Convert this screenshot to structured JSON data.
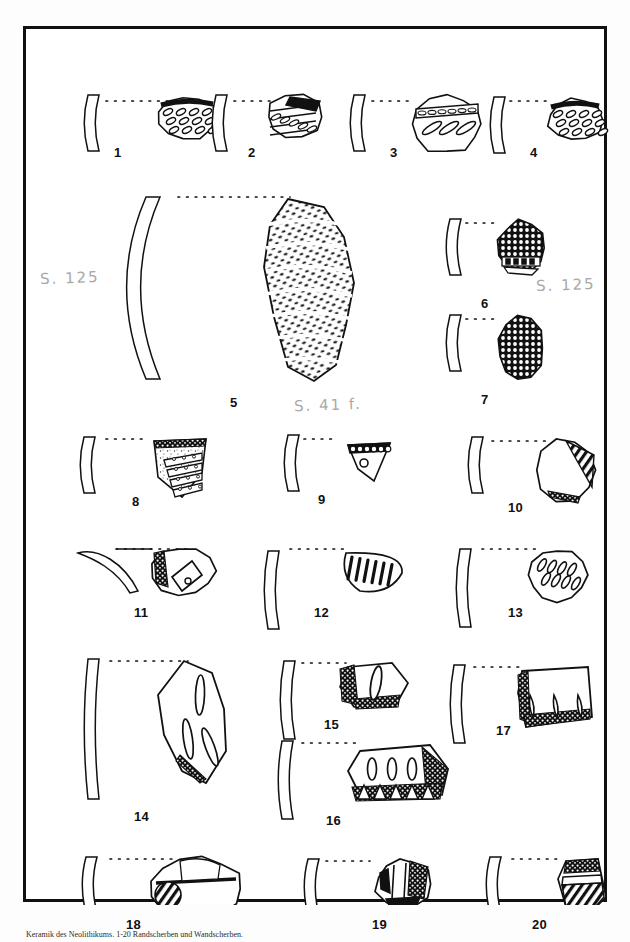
{
  "plate": {
    "title": "Archaeological pottery sherd plate",
    "caption": "Keramik des Neolithikums. 1-20 Randscherben und Wandscherben.",
    "frame_color": "#111111",
    "ink_color": "#111111",
    "pencil_color": "#9a9a9a",
    "background": "#ffffff"
  },
  "annotations": [
    {
      "id": "note-left",
      "text": "S. 125",
      "x": 14,
      "y": 240
    },
    {
      "id": "note-right",
      "text": "S. 125",
      "x": 510,
      "y": 247
    },
    {
      "id": "note-center",
      "text": "S. 41 f.",
      "x": 268,
      "y": 367
    }
  ],
  "items": [
    {
      "n": "1",
      "label_x": 88,
      "label_y": 116,
      "profile_x": 62,
      "profile_y": 66,
      "rim_x": 80,
      "rim_y": 72,
      "rim_w": 62,
      "sherd_x": 132,
      "sherd_y": 68,
      "decor": "oval-rows"
    },
    {
      "n": "2",
      "label_x": 222,
      "label_y": 116,
      "profile_x": 190,
      "profile_y": 66,
      "rim_x": 208,
      "rim_y": 72,
      "rim_w": 36,
      "sherd_x": 240,
      "sherd_y": 66,
      "decor": "diagonal-bands"
    },
    {
      "n": "3",
      "label_x": 364,
      "label_y": 116,
      "profile_x": 328,
      "profile_y": 66,
      "rim_x": 346,
      "rim_y": 72,
      "rim_w": 42,
      "sherd_x": 386,
      "sherd_y": 66,
      "decor": "slash-band"
    },
    {
      "n": "4",
      "label_x": 504,
      "label_y": 116,
      "profile_x": 468,
      "profile_y": 68,
      "rim_x": 484,
      "rim_y": 72,
      "rim_w": 42,
      "sherd_x": 522,
      "sherd_y": 70,
      "decor": "oval-rows"
    },
    {
      "n": "5",
      "label_x": 204,
      "label_y": 366,
      "profile_x": 120,
      "profile_y": 168,
      "rim_x": 152,
      "rim_y": 168,
      "rim_w": 112,
      "sherd_x": 232,
      "sherd_y": 168,
      "decor": "comb-wavy"
    },
    {
      "n": "6",
      "label_x": 455,
      "label_y": 267,
      "profile_x": 424,
      "profile_y": 190,
      "rim_x": 440,
      "rim_y": 194,
      "rim_w": 34,
      "sherd_x": 472,
      "sherd_y": 192,
      "decor": "net-dots"
    },
    {
      "n": "7",
      "label_x": 455,
      "label_y": 363,
      "profile_x": 424,
      "profile_y": 286,
      "rim_x": 440,
      "rim_y": 290,
      "rim_w": 34,
      "sherd_x": 472,
      "sherd_y": 288,
      "decor": "net-dots"
    },
    {
      "n": "8",
      "label_x": 106,
      "label_y": 465,
      "profile_x": 58,
      "profile_y": 408,
      "rim_x": 80,
      "rim_y": 410,
      "rim_w": 42,
      "sherd_x": 122,
      "sherd_y": 408,
      "decor": "stipple-bands"
    },
    {
      "n": "9",
      "label_x": 292,
      "label_y": 463,
      "profile_x": 262,
      "profile_y": 406,
      "rim_x": 278,
      "rim_y": 410,
      "rim_w": 32,
      "sherd_x": 318,
      "sherd_y": 410,
      "decor": "circle-row"
    },
    {
      "n": "10",
      "label_x": 482,
      "label_y": 471,
      "profile_x": 446,
      "profile_y": 408,
      "rim_x": 466,
      "rim_y": 412,
      "rim_w": 56,
      "sherd_x": 510,
      "sherd_y": 410,
      "decor": "hatched-corner"
    },
    {
      "n": "11",
      "label_x": 108,
      "label_y": 576,
      "profile_x": 52,
      "profile_y": 518,
      "rim_x": 90,
      "rim_y": 520,
      "rim_w": 76,
      "sherd_x": 126,
      "sherd_y": 518,
      "decor": "lug-handle"
    },
    {
      "n": "12",
      "label_x": 288,
      "label_y": 576,
      "profile_x": 242,
      "profile_y": 522,
      "rim_x": 264,
      "rim_y": 520,
      "rim_w": 56,
      "sherd_x": 312,
      "sherd_y": 520,
      "decor": "slash-fan"
    },
    {
      "n": "13",
      "label_x": 482,
      "label_y": 576,
      "profile_x": 434,
      "profile_y": 520,
      "rim_x": 456,
      "rim_y": 520,
      "rim_w": 56,
      "sherd_x": 502,
      "sherd_y": 520,
      "decor": "oval-slashes"
    },
    {
      "n": "14",
      "label_x": 108,
      "label_y": 780,
      "profile_x": 62,
      "profile_y": 630,
      "rim_x": 84,
      "rim_y": 632,
      "rim_w": 78,
      "sherd_x": 128,
      "sherd_y": 630,
      "decor": "slot-impressions"
    },
    {
      "n": "15",
      "label_x": 298,
      "label_y": 688,
      "profile_x": 258,
      "profile_y": 632,
      "rim_x": 276,
      "rim_y": 634,
      "rim_w": 44,
      "sherd_x": 312,
      "sherd_y": 632,
      "decor": "rough-edge-oval"
    },
    {
      "n": "16",
      "label_x": 300,
      "label_y": 784,
      "profile_x": 256,
      "profile_y": 712,
      "rim_x": 276,
      "rim_y": 714,
      "rim_w": 58,
      "sherd_x": 320,
      "sherd_y": 714,
      "decor": "oval-claw"
    },
    {
      "n": "17",
      "label_x": 470,
      "label_y": 694,
      "profile_x": 428,
      "profile_y": 636,
      "rim_x": 448,
      "rim_y": 638,
      "rim_w": 46,
      "sherd_x": 490,
      "sherd_y": 636,
      "decor": "claw-row"
    },
    {
      "n": "18",
      "label_x": 100,
      "label_y": 888,
      "profile_x": 60,
      "profile_y": 828,
      "rim_x": 84,
      "rim_y": 830,
      "rim_w": 62,
      "sherd_x": 124,
      "sherd_y": 828,
      "decor": "band-boss"
    },
    {
      "n": "19",
      "label_x": 346,
      "label_y": 888,
      "profile_x": 282,
      "profile_y": 830,
      "rim_x": 300,
      "rim_y": 832,
      "rim_w": 44,
      "sherd_x": 350,
      "sherd_y": 830,
      "decor": "vertical-facets"
    },
    {
      "n": "20",
      "label_x": 506,
      "label_y": 888,
      "profile_x": 464,
      "profile_y": 828,
      "rim_x": 486,
      "rim_y": 830,
      "rim_w": 48,
      "sherd_x": 528,
      "sherd_y": 828,
      "decor": "diagonal-hatch"
    }
  ]
}
